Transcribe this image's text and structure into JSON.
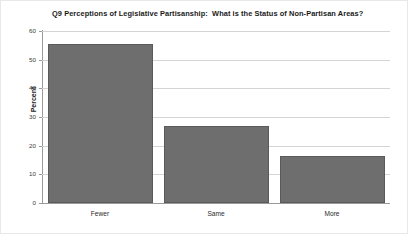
{
  "chart_data": {
    "type": "bar",
    "title": "Q9 Perceptions of Legislative Partisanship:  What is the Status of Non-Partisan Areas?",
    "categories": [
      "Fewer",
      "Same",
      "More"
    ],
    "values": [
      55.5,
      27,
      16.5
    ],
    "xlabel": "",
    "ylabel": "Percent",
    "ylim": [
      0,
      60
    ],
    "yticks": [
      0,
      10,
      20,
      30,
      40,
      50,
      60
    ],
    "ytick_labels": [
      "0",
      "10",
      "20",
      "30",
      "40",
      "50",
      "60"
    ],
    "grid": true,
    "legend": false,
    "bar_color": "#6e6e6e",
    "grid_color": "#d4d4d4",
    "axis_color": "#9a9a9a",
    "background": "#ffffff"
  }
}
